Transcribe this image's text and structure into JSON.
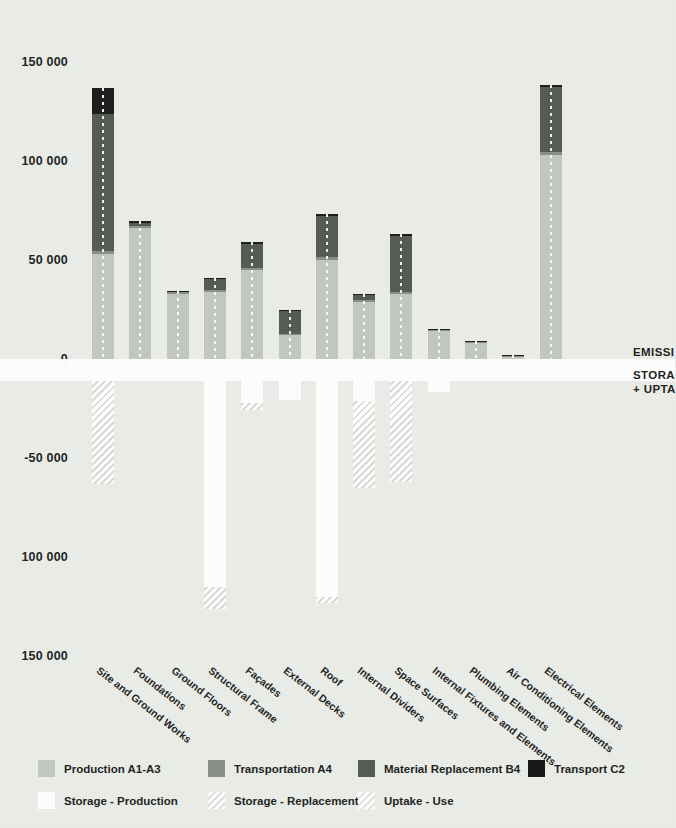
{
  "chart_data": {
    "type": "bar",
    "title": "",
    "xlabel": "",
    "ylabel": "",
    "ylim": [
      -150000,
      150000
    ],
    "grid": false,
    "stacked": true,
    "legend_position": "bottom",
    "yticks": [
      "150 000",
      "100 000",
      "50 000",
      "0",
      "-50 000",
      "100 000",
      "150 000"
    ],
    "ytick_values": [
      150000,
      100000,
      50000,
      0,
      -50000,
      -100000,
      -150000
    ],
    "categories": [
      "Site and Ground Works",
      "Foundations",
      "Ground Floors",
      "Structural Frame",
      "Façades",
      "External Decks",
      "Roof",
      "Internal Dividers",
      "Space Surfaces",
      "Internal Fixtures and Elements",
      "Plumbing Elements",
      "Air Conditioning Elements",
      "Electrical Elements"
    ],
    "series": [
      {
        "name": "Production A1-A3",
        "key": "prod",
        "color": "#c3c7c2",
        "values": [
          53000,
          66000,
          33000,
          34000,
          45000,
          12000,
          50000,
          29000,
          33000,
          14000,
          8500,
          1500,
          103000
        ]
      },
      {
        "name": "Transportation A4",
        "key": "trans",
        "color": "#8b8f8a",
        "values": [
          1500,
          1200,
          900,
          900,
          1200,
          600,
          1300,
          800,
          900,
          600,
          300,
          200,
          1500
        ]
      },
      {
        "name": "Material Replacement B4",
        "key": "matrep",
        "color": "#565a55",
        "values": [
          69000,
          1500,
          0,
          5500,
          12000,
          11500,
          21000,
          2500,
          28000,
          0,
          0,
          0,
          33000
        ]
      },
      {
        "name": "Transport C2",
        "key": "tc2",
        "color": "#1b1d1b",
        "values": [
          13500,
          900,
          400,
          500,
          800,
          400,
          800,
          400,
          1200,
          300,
          200,
          100,
          1000
        ]
      },
      {
        "name": "Storage - Production",
        "key": "stprod",
        "color": "#ffffff",
        "values": [
          0,
          0,
          0,
          -104000,
          -11000,
          -9500,
          -109000,
          -10000,
          0,
          -5500,
          0,
          0,
          0
        ]
      },
      {
        "name": "Storage - Replacement",
        "key": "strep",
        "color": "#ffffff",
        "values": [
          -52000,
          0,
          0,
          -11000,
          -3500,
          0,
          -3000,
          -44000,
          -51000,
          0,
          0,
          0,
          0
        ]
      },
      {
        "name": "Uptake - Use",
        "key": "uptake",
        "color": "#ffffff",
        "values": [
          0,
          0,
          0,
          0,
          0,
          0,
          0,
          0,
          0,
          0,
          0,
          0,
          0
        ]
      }
    ],
    "annotations": [
      {
        "id": "emissions",
        "text": "EMISSI"
      },
      {
        "id": "storage-line1",
        "text": "STORA"
      },
      {
        "id": "storage-line2",
        "text": "+ UPTA"
      }
    ]
  },
  "legend": {
    "items": [
      {
        "label": "Production A1-A3",
        "swatch": "sw-prod"
      },
      {
        "label": "Transportation A4",
        "swatch": "sw-trans"
      },
      {
        "label": "Material Replacement B4",
        "swatch": "sw-matrep"
      },
      {
        "label": "Transport C2",
        "swatch": "sw-tc2"
      },
      {
        "label": "Storage - Production",
        "swatch": "sw-stprod"
      },
      {
        "label": "Storage - Replacement",
        "swatch": "sw-strep"
      },
      {
        "label": "Uptake - Use",
        "swatch": "sw-uptake"
      }
    ]
  },
  "colors": {
    "background": "#eceeea",
    "text": "#1d1f1d",
    "zero_band": "#ffffff"
  }
}
